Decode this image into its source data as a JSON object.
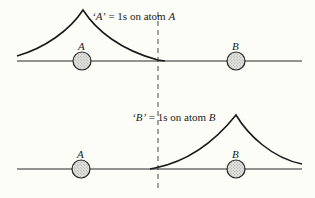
{
  "diagram": {
    "panels": [
      {
        "id": "A",
        "label_quote": "‘A’",
        "label_equals": " = ",
        "label_text": "1s on atom ",
        "label_atom": "A",
        "atoms": [
          {
            "name": "A",
            "label": "A"
          },
          {
            "name": "B",
            "label": "B"
          }
        ]
      },
      {
        "id": "B",
        "label_quote": "‘B’",
        "label_equals": " = ",
        "label_text": "1s on atom ",
        "label_atom": "B",
        "atoms": [
          {
            "name": "A",
            "label": "A"
          },
          {
            "name": "B",
            "label": "B"
          }
        ]
      }
    ],
    "colors": {
      "line": "#1a1a1a",
      "atom_fill": "#d0d0d0",
      "background": "#fdfdf8"
    }
  }
}
